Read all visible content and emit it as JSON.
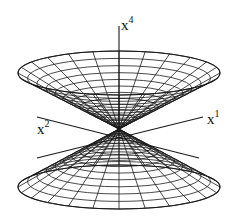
{
  "diagram": {
    "type": "3d-wireframe-double-cone",
    "colors": {
      "stroke": "#1a1a1a",
      "background": "#ffffff"
    },
    "apex": {
      "x": 119,
      "y": 129
    },
    "upper_cone": {
      "rim_center_y": 73,
      "rim_rx": 101,
      "rim_ry": 22,
      "radial_lines": 24,
      "rings": 14
    },
    "lower_cone": {
      "rim_center_y": 187,
      "rim_rx": 101,
      "rim_ry": 22,
      "radial_lines": 24,
      "rings": 14
    },
    "axes": [
      {
        "name": "x4",
        "base": "x",
        "sup": "4",
        "label_pos": [
          121,
          18
        ]
      },
      {
        "name": "x2",
        "base": "x",
        "sup": "2",
        "label_pos": [
          37,
          122
        ]
      },
      {
        "name": "x1",
        "base": "x",
        "sup": "1",
        "label_pos": [
          207,
          112
        ]
      }
    ]
  }
}
